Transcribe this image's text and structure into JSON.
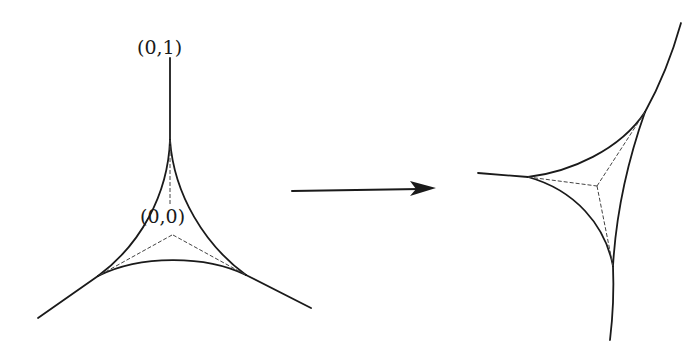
{
  "diagram": {
    "type": "deltoid-transformation",
    "left_figure": {
      "labels": {
        "top_point": "(0,1)",
        "center_point": "(0,0)"
      }
    },
    "arrow": {
      "direction": "right"
    },
    "right_figure": {
      "labels": {}
    },
    "colors": {
      "stroke": "#1a1a1a",
      "dashed": "#444444",
      "background": "#ffffff"
    }
  }
}
